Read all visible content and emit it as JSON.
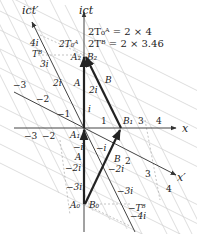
{
  "diagram": {
    "axes": {
      "time": "ict",
      "time_prime": "ict′",
      "space": "x",
      "space_prime": "x′"
    },
    "annotations": {
      "line1": "2T₀ᴬ = 2 × 4",
      "line2": "2Tᴮ = 2 × 3.46"
    },
    "points": {
      "A0": "A₀",
      "A1": "A₁",
      "A2": "A₂",
      "B0": "B₀",
      "B1": "B₁",
      "B2": "B₂",
      "A": "A",
      "B": "B",
      "TB_top": "Tᴮ",
      "TB_bottom": "−Tᴮ",
      "2TA0": "2T₀ᴬ"
    },
    "x_ticks_pos": [
      "1",
      "3",
      "4"
    ],
    "x_ticks_neg": [
      "−3",
      "−2"
    ],
    "t_ticks_pos": [
      "i",
      "2i"
    ],
    "t_ticks_neg": [
      "−i",
      "−2i",
      "−3i"
    ],
    "xprime_ticks_pos": [
      "2",
      "3",
      "4"
    ],
    "xprime_ticks_neg": [
      "−1",
      "−2",
      "−3"
    ],
    "tprime_ticks_pos": [
      "2i",
      "3i",
      "4i"
    ],
    "tprime_ticks_neg": [
      "−i",
      "−2i",
      "−3i",
      "−4i"
    ],
    "beta": 0.5,
    "colors": {
      "axis": "#555555",
      "grid": "#c8c8c8",
      "worldline": "#222222"
    }
  }
}
